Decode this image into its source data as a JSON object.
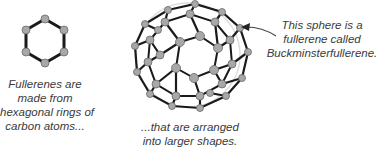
{
  "diagram": {
    "title": "Fullerenes",
    "captions": {
      "hexagon": [
        "Fullerenes are",
        "made from",
        "hexagonal rings of",
        "carbon atoms..."
      ],
      "sphere": [
        "...that are arranged",
        "into larger shapes."
      ],
      "annotation": [
        "This sphere is a",
        "fullerene called",
        "Buckminsterfullerene."
      ]
    },
    "elements": {
      "hexagon_ring": "hexagonal carbon ring (6 atoms)",
      "buckyball": "Buckminsterfullerene sphere (C60)",
      "arrow": "arrow pointing to sphere"
    },
    "colors": {
      "atom_fill": "#a8a8a8",
      "atom_stroke": "#6a6a6a",
      "bond": "#1a1a1a",
      "text": "#3a3a3a"
    }
  }
}
